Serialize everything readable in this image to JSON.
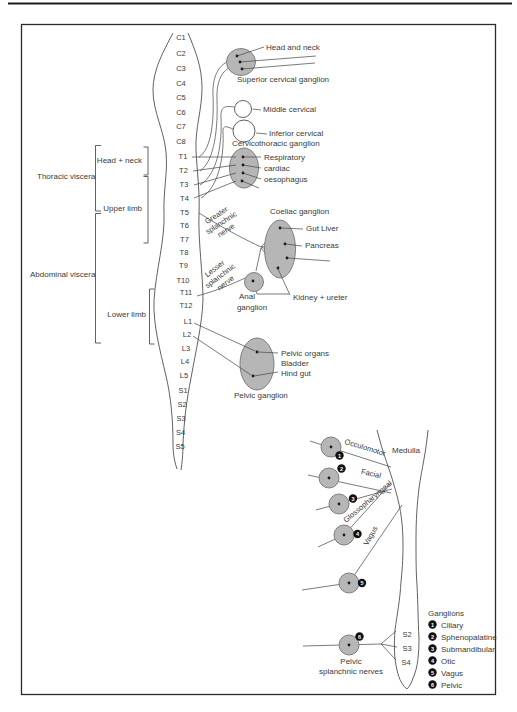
{
  "page": {
    "bg": "#ffffff",
    "ink": "#3a3a3a",
    "line_color": "#4f4f4f",
    "ganglion_fill": "#b6b6b6",
    "ganglion_stroke": "#757575"
  },
  "spine": {
    "segments": [
      "C1",
      "C2",
      "C3",
      "C4",
      "C5",
      "C6",
      "C7",
      "C8",
      "T1",
      "T2",
      "T3",
      "T4",
      "T5",
      "T6",
      "T7",
      "T8",
      "T9",
      "T10",
      "T11",
      "T12",
      "L1",
      "L2",
      "L3",
      "L4",
      "L5",
      "S1",
      "S2",
      "S3",
      "S4",
      "S5"
    ]
  },
  "regions": {
    "thoracic_viscera": "Thoracic viscera",
    "abdominal_viscera": "Abdominal viscera",
    "head_neck": "Head + neck",
    "upper_limb": "Upper limb",
    "lower_limb": "Lower limb"
  },
  "cervical": {
    "head_and_neck": "Head and neck",
    "superior_cervical_ganglion": "Superior cervical ganglion",
    "middle_cervical": "Middle cervical",
    "inferior_cervical": "Inferior cervical",
    "cervicothoracic_ganglion": "Cervicothoracic ganglion"
  },
  "thoracic": {
    "respiratory": "Respiratory",
    "cardiac": "cardiac",
    "oesophagus": "oesophagus",
    "greater_splanchnic": [
      "Greater",
      "splanchnic",
      "nerve"
    ],
    "lesser_splanchnic": [
      "Lesser",
      "splanchnic",
      "nerve"
    ],
    "coeliac_ganglion": "Coeliac ganglion",
    "gut_liver": "Gut Liver",
    "pancreas": "Pancreas",
    "kidney_ureter": "Kidney + ureter",
    "anal_ganglion": [
      "Anal",
      "ganglion"
    ]
  },
  "pelvic": {
    "pelvic_organs": "Pelvic organs",
    "bladder": "Bladder",
    "hind_gut": "Hind gut",
    "pelvic_ganglion": "Pelvic ganglion"
  },
  "cranial": {
    "medulla": "Medulla",
    "occulomotor": "Occulomotor",
    "facial": "Facial",
    "glossopharyngeal": "Glossopharyngeal",
    "vagus": "Vagus",
    "pelvic_splanchnic": [
      "Pelvic",
      "splanchnic nerves"
    ],
    "sacral": [
      "S2",
      "S3",
      "S4"
    ]
  },
  "legend": {
    "title": "Ganglions",
    "items": [
      {
        "num": "1",
        "label": "Ciliary"
      },
      {
        "num": "2",
        "label": "Sphenopalatine"
      },
      {
        "num": "3",
        "label": "Submandibular"
      },
      {
        "num": "4",
        "label": "Otic"
      },
      {
        "num": "5",
        "label": "Vagus"
      },
      {
        "num": "6",
        "label": "Pelvic"
      }
    ]
  }
}
